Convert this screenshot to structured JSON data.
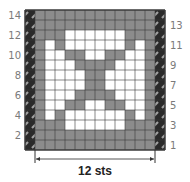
{
  "chart": {
    "colors": {
      "contrast": "#8c8c8c",
      "main": "#ffffff",
      "gridline": "#3a3a3a",
      "edge": "#2a2a2a",
      "edge_hatch": "#9a9a9a"
    },
    "stitch_count_label": "12 sts",
    "rows_total": 14,
    "edge_stitch_symbol": "hatched-edge-stitch",
    "left_row_labels": [
      "14",
      "12",
      "10",
      "8",
      "6",
      "4",
      "2"
    ],
    "right_row_labels": [
      "13",
      "11",
      "9",
      "7",
      "5",
      "3",
      "1"
    ],
    "legend_key": "g = contrast (gray), w = main (white); rows listed top (14) to bottom (1)",
    "grid_rows": [
      {
        "row": "14",
        "cells": "gggggggggggg"
      },
      {
        "row": "13",
        "cells": "gggggggggggg"
      },
      {
        "row": "12",
        "cells": "gggwwwwwwggg"
      },
      {
        "row": "11",
        "cells": "gwgwwwwwwgwg"
      },
      {
        "row": "10",
        "cells": "gwwggwwggwwg"
      },
      {
        "row": "9",
        "cells": "gwwwggggwwwg"
      },
      {
        "row": "8",
        "cells": "gwwwwggwwwwg"
      },
      {
        "row": "7",
        "cells": "gwwwwggwwwwg"
      },
      {
        "row": "6",
        "cells": "gwwwggggwwwg"
      },
      {
        "row": "5",
        "cells": "gwwggwwggwwg"
      },
      {
        "row": "4",
        "cells": "gwgwwwwwwgwg"
      },
      {
        "row": "3",
        "cells": "gggwwwwwwggg"
      },
      {
        "row": "2",
        "cells": "gggggggggggg"
      },
      {
        "row": "1",
        "cells": "gggggggggggg"
      }
    ]
  }
}
